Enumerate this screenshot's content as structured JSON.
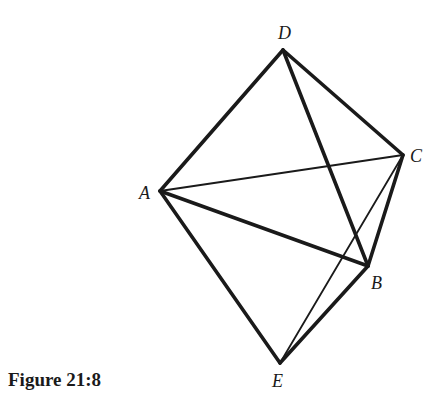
{
  "figure": {
    "caption": "Figure 21:8",
    "ink_color": "#1a1a1a",
    "vertices": {
      "A": {
        "label": "A",
        "x": 160,
        "y": 191,
        "lx": 139,
        "ly": 199
      },
      "B": {
        "label": "B",
        "x": 368,
        "y": 266,
        "lx": 371,
        "ly": 289
      },
      "C": {
        "label": "C",
        "x": 403,
        "y": 155,
        "lx": 410,
        "ly": 162
      },
      "D": {
        "label": "D",
        "x": 283,
        "y": 50,
        "lx": 278,
        "ly": 39
      },
      "E": {
        "label": "E",
        "x": 280,
        "y": 363,
        "lx": 272,
        "ly": 387
      }
    },
    "edges": [
      {
        "from": "D",
        "to": "A",
        "weight": "thick"
      },
      {
        "from": "D",
        "to": "C",
        "weight": "thick"
      },
      {
        "from": "D",
        "to": "B",
        "weight": "thick"
      },
      {
        "from": "A",
        "to": "B",
        "weight": "thick"
      },
      {
        "from": "A",
        "to": "E",
        "weight": "thick"
      },
      {
        "from": "E",
        "to": "B",
        "weight": "thick"
      },
      {
        "from": "B",
        "to": "C",
        "weight": "thick"
      },
      {
        "from": "A",
        "to": "C",
        "weight": "thin"
      },
      {
        "from": "E",
        "to": "C",
        "weight": "thin"
      }
    ]
  }
}
